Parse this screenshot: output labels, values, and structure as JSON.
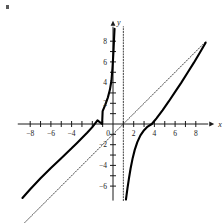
{
  "figure": {
    "title": "",
    "corner_mark": "speck-artifact"
  },
  "axes": {
    "x_axis_label": "x",
    "y_axis_label": "y",
    "x_tick_labels": [
      "-8",
      "-6",
      "-4",
      "0",
      "2",
      "4",
      "6",
      "8"
    ],
    "y_tick_labels": [
      "8",
      "6",
      "4",
      "2",
      "-2",
      "-4",
      "-6"
    ],
    "origin_label": "0"
  },
  "chart_data": {
    "type": "line",
    "title": "",
    "xlabel": "x",
    "ylabel": "y",
    "xlim": [
      -9.2,
      9.2
    ],
    "ylim": [
      -7.4,
      9.4
    ],
    "grid": false,
    "legend": "none",
    "x_ticks": [
      -8,
      -7,
      -6,
      -5,
      -4,
      -3,
      -2,
      -1,
      1,
      2,
      3,
      4,
      5,
      6,
      7,
      8
    ],
    "x_tick_labels_shown": [
      -8,
      -6,
      -4,
      2,
      4,
      6,
      8
    ],
    "y_ticks": [
      -6,
      -5,
      -4,
      -3,
      -2,
      -1,
      1,
      2,
      3,
      4,
      5,
      6,
      7,
      8
    ],
    "y_tick_labels_shown": [
      8,
      6,
      4,
      2,
      -2,
      -4,
      -6
    ],
    "vertical_asymptote": {
      "x": 1,
      "style": "dotted",
      "label": "x = 1"
    },
    "oblique_asymptote": {
      "slope": 1,
      "intercept": -1,
      "style": "dotted",
      "label": "y = x - 1"
    },
    "x_intercepts": [
      -1.05,
      3.75
    ],
    "series": [
      {
        "name": "left-branch",
        "style": "solid",
        "points": [
          [
            -8.75,
            -7.15
          ],
          [
            -8.0,
            -6.3
          ],
          [
            -7.0,
            -5.25
          ],
          [
            -6.0,
            -4.25
          ],
          [
            -5.0,
            -3.3
          ],
          [
            -4.0,
            -2.35
          ],
          [
            -3.5,
            -1.85
          ],
          [
            -3.0,
            -1.35
          ],
          [
            -2.5,
            -0.85
          ],
          [
            -2.0,
            -0.3
          ],
          [
            -1.5,
            0.35
          ],
          [
            -1.05,
            0.0
          ],
          [
            -1.0,
            1.25
          ],
          [
            -0.75,
            1.85
          ],
          [
            -0.5,
            2.55
          ],
          [
            -0.3,
            3.3
          ],
          [
            -0.15,
            4.2
          ],
          [
            -0.05,
            5.4
          ],
          [
            0.0,
            6.2
          ],
          [
            0.05,
            7.1
          ],
          [
            0.1,
            8.2
          ],
          [
            0.15,
            9.2
          ]
        ]
      },
      {
        "name": "right-branch",
        "style": "solid",
        "points": [
          [
            1.25,
            -7.3
          ],
          [
            1.4,
            -6.2
          ],
          [
            1.55,
            -5.2
          ],
          [
            1.7,
            -4.3
          ],
          [
            1.9,
            -3.3
          ],
          [
            2.1,
            -2.5
          ],
          [
            2.35,
            -1.75
          ],
          [
            2.65,
            -1.1
          ],
          [
            3.0,
            -0.6
          ],
          [
            3.35,
            -0.25
          ],
          [
            3.75,
            0.0
          ],
          [
            4.2,
            0.55
          ],
          [
            4.8,
            1.35
          ],
          [
            5.4,
            2.2
          ],
          [
            6.0,
            3.1
          ],
          [
            6.6,
            4.0
          ],
          [
            7.2,
            4.95
          ],
          [
            7.8,
            5.9
          ],
          [
            8.4,
            6.9
          ],
          [
            8.95,
            7.85
          ]
        ]
      }
    ],
    "annotations": [
      {
        "text": "vertical dotted asymptote at x = 1"
      },
      {
        "text": "dotted oblique asymptote through (1,0) with slope 1"
      }
    ]
  }
}
